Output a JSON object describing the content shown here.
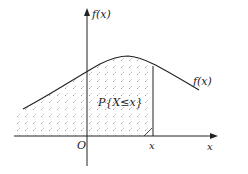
{
  "diagram": {
    "y_axis_label": "f(x)",
    "x_axis_label": "x",
    "origin_label": "O",
    "x_marker_label": "x",
    "curve_label": "f(x)",
    "area_label": "P{X≤x}",
    "colors": {
      "stroke": "#222222",
      "hatch": "#555555",
      "background": "#ffffff"
    }
  }
}
